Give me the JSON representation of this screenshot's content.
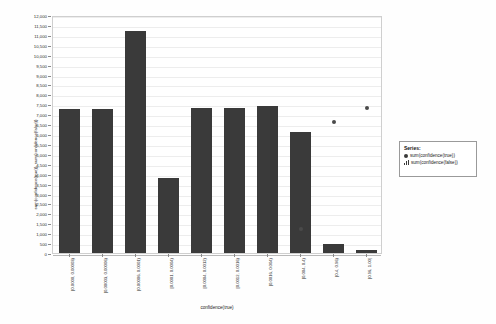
{
  "chart_data": {
    "type": "bar",
    "title": "",
    "xlabel": "confidence(true)",
    "ylabel": "sum(confidence(true)), sum(confidence(false))",
    "ylim": [
      0,
      12000
    ],
    "ytick_step": 500,
    "grid": true,
    "legend_position": "right",
    "categories": [
      "[0.0000, 0.00003)",
      "[0.00003, 0.00006)",
      "[0.00006, 0.0001)",
      "[0.0001, 0.0004)",
      "[0.0004, 0.0012)",
      "[0.0012, 0.0016)",
      "[0.0016, 0.004)",
      "[0.004, 0.4)",
      "[0.4, 0.96)",
      "[0.96, 1.00]"
    ],
    "ytick_labels": [
      "12,000",
      "11,500",
      "11,000",
      "10,500",
      "10,000",
      "9,500",
      "9,000",
      "8,500",
      "8,000",
      "7,500",
      "7,000",
      "6,500",
      "6,000",
      "5,500",
      "5,000",
      "4,500",
      "4,000",
      "3,500",
      "3,000",
      "2,500",
      "2,000",
      "1,500",
      "1,000",
      "500",
      "0"
    ],
    "series": [
      {
        "name": "sum(confidence(false))",
        "marker": "bar",
        "values": [
          7250,
          7240,
          11200,
          3800,
          7290,
          7290,
          7420,
          6080,
          470,
          175
        ]
      },
      {
        "name": "sum(confidence(true))",
        "marker": "dot",
        "values": [
          null,
          null,
          null,
          null,
          null,
          null,
          null,
          1230,
          6620,
          7300
        ]
      }
    ],
    "colors": {
      "bar": "#3a3a3a",
      "point": "#4a4a4a",
      "grid": "#ededed",
      "frame": "#cfcfcf",
      "background": "#ffffff"
    }
  },
  "legend": {
    "title": "Series:",
    "entries": [
      {
        "label": "sum(confidence(true))",
        "marker": "dot"
      },
      {
        "label": "sum(confidence(false))",
        "marker": "bars"
      }
    ]
  }
}
